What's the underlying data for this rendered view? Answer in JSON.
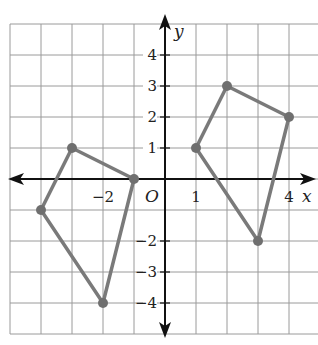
{
  "diagram": {
    "type": "coordinate-plane",
    "x_axis_label": "x",
    "y_axis_label": "y",
    "origin_label": "O",
    "x_range": [
      -5,
      5
    ],
    "y_range": [
      -5,
      5
    ],
    "x_tick_labels": [
      {
        "value": -2,
        "label": "−2"
      },
      {
        "value": 1,
        "label": "1"
      },
      {
        "value": 4,
        "label": "4"
      }
    ],
    "y_tick_labels": [
      {
        "value": 4,
        "label": "4"
      },
      {
        "value": 3,
        "label": "3"
      },
      {
        "value": 2,
        "label": "2"
      },
      {
        "value": 1,
        "label": "1"
      },
      {
        "value": -2,
        "label": "−2"
      },
      {
        "value": -3,
        "label": "−3"
      },
      {
        "value": -4,
        "label": "−4"
      }
    ],
    "polygons": [
      {
        "name": "left-quadrilateral",
        "vertices": [
          [
            -3,
            1
          ],
          [
            -1,
            0
          ],
          [
            -2,
            -4
          ],
          [
            -4,
            -1
          ]
        ]
      },
      {
        "name": "right-quadrilateral",
        "vertices": [
          [
            2,
            3
          ],
          [
            4,
            2
          ],
          [
            3,
            -2
          ],
          [
            1,
            1
          ]
        ]
      }
    ],
    "colors": {
      "grid": "#9a9a9a",
      "axes": "#111111",
      "polygon": "#7a7a7a"
    }
  }
}
